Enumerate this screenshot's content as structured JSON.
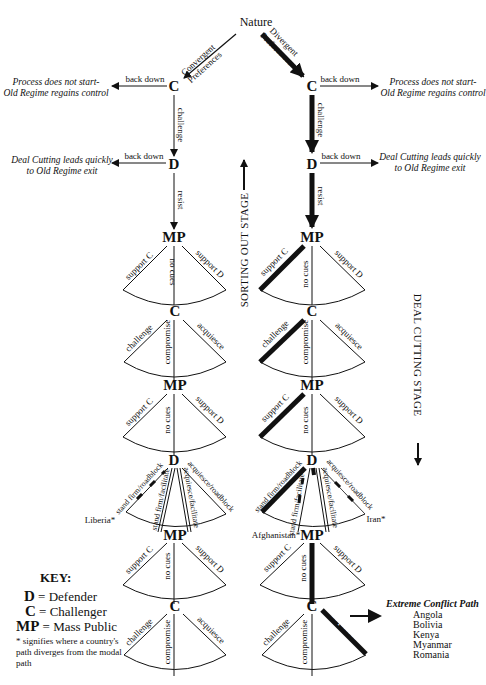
{
  "title": "Nature",
  "branches": {
    "convergent": "Convergent Preferences",
    "divergent": "Divergent Preferences"
  },
  "nodes": {
    "challenger": "C",
    "defender": "D",
    "mass_public": "MP"
  },
  "edge_labels": {
    "back_down": "back down",
    "challenge": "challenge",
    "resist": "resist",
    "support_c": "support C",
    "support_d": "support D",
    "no_cues": "no cues",
    "compromise": "compromise",
    "acquiesce": "acquiesce",
    "stand_firm_roadblock": "stand firm/roadblock",
    "stand_firm_facilitate": "stand firm/facilitate",
    "acquiesce_facilitate": "acquiesce/facilitate",
    "acquiesce_roadblock": "acquiesce/roadblock"
  },
  "outcomes": {
    "process_line1": "Process does not start-",
    "process_line2": "Old Regime regains control",
    "deal_line1": "Deal Cutting leads quickly",
    "deal_line2": "to Old Regime exit"
  },
  "stages": {
    "sorting_out": "SORTING OUT STAGE",
    "deal_cutting": "DEAL CUTTING STAGE"
  },
  "country_markers": {
    "liberia": "Liberia*",
    "afghanistan": "Afghanistan*",
    "iran": "Iran*"
  },
  "key": {
    "title": "KEY:",
    "items": [
      {
        "symbol": "D",
        "meaning": "= Defender"
      },
      {
        "symbol": "C",
        "meaning": "= Challenger"
      },
      {
        "symbol": "MP",
        "meaning": "= Mass Public"
      }
    ],
    "note": "* signifies where a country's path diverges from the modal path"
  },
  "extreme_conflict": {
    "title": "Extreme Conflict Path",
    "countries": [
      "Angola",
      "Bolivia",
      "Kenya",
      "Myanmar",
      "Romania"
    ]
  },
  "colors": {
    "line": "#111111",
    "background": "#ffffff"
  }
}
